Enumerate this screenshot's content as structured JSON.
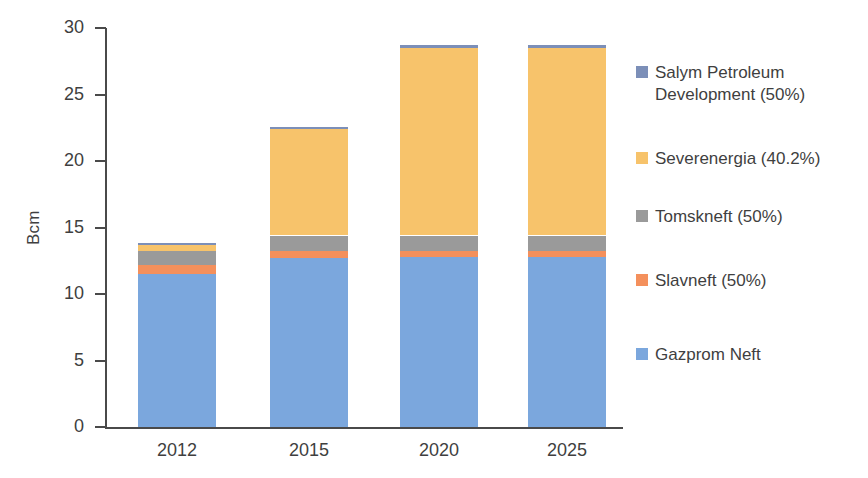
{
  "chart_data": {
    "type": "bar",
    "subtype": "stacked-bar",
    "title": "",
    "xlabel": "",
    "ylabel": "Bcm",
    "categories": [
      "2012",
      "2015",
      "2020",
      "2025"
    ],
    "ylim": [
      0,
      30
    ],
    "yticks": [
      0,
      5,
      10,
      15,
      20,
      25,
      30
    ],
    "ytick_labels": [
      "0",
      "5",
      "10",
      "15",
      "20",
      "25",
      "30"
    ],
    "grid": false,
    "legend_position": "right",
    "stack_order_bottom_to_top": [
      "Gazprom Neft",
      "Slavneft (50%)",
      "Tomskneft (50%)",
      "Severenergia (40.2%)",
      "Salym Petroleum Development  (50%)"
    ],
    "series": [
      {
        "name": "Salym Petroleum Development  (50%)",
        "legend_label": "Salym Petroleum\nDevelopment  (50%)",
        "color": "#7c8fb8",
        "values": [
          0.15,
          0.15,
          0.2,
          0.2
        ]
      },
      {
        "name": "Severenergia (40.2%)",
        "legend_label": "Severenergia (40.2%)",
        "color": "#f7c36b",
        "values": [
          0.45,
          8.0,
          14.1,
          14.1
        ]
      },
      {
        "name": "Tomskneft (50%)",
        "legend_label": "Tomskneft (50%)",
        "color": "#9a9a9a",
        "values": [
          1.0,
          1.2,
          1.2,
          1.2
        ]
      },
      {
        "name": "Slavneft (50%)",
        "legend_label": "Slavneft (50%)",
        "color": "#f4905c",
        "values": [
          0.7,
          0.5,
          0.4,
          0.4
        ]
      },
      {
        "name": "Gazprom Neft",
        "legend_label": "Gazprom Neft",
        "color": "#7ba7dd",
        "values": [
          11.5,
          12.7,
          12.8,
          12.8
        ]
      }
    ],
    "totals": [
      13.8,
      22.55,
      28.7,
      28.7
    ]
  },
  "axis": {
    "y_title": "Bcm"
  },
  "colors": {
    "salym": "#7c8fb8",
    "severenergia": "#f7c36b",
    "tomskneft": "#9a9a9a",
    "slavneft": "#f4905c",
    "gazprom": "#7ba7dd",
    "axis": "#4a4a4a",
    "text": "#3f3f3f",
    "background": "#ffffff"
  }
}
